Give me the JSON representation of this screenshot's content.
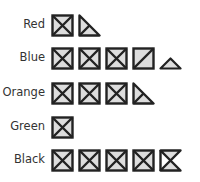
{
  "chart_data": {
    "type": "pictograph",
    "title": "",
    "unit_icon": "square with X (divided into 4 triangular quarters)",
    "categories": [
      "Red",
      "Blue",
      "Orange",
      "Green",
      "Black"
    ],
    "values": [
      1.5,
      4.25,
      3.5,
      1,
      4.5
    ],
    "icons": {
      "Red": [
        "full",
        "half-lower-left"
      ],
      "Blue": [
        "full",
        "full",
        "full",
        "diag-full",
        "quarter-bottom"
      ],
      "Orange": [
        "full",
        "full",
        "full",
        "half-lower-left"
      ],
      "Green": [
        "full"
      ],
      "Black": [
        "full",
        "full",
        "full",
        "full",
        "hourglass"
      ]
    },
    "colors": {
      "fill": "#dddddd",
      "stroke": "#222222",
      "label": "#333333"
    }
  },
  "rows": [
    {
      "label": "Red"
    },
    {
      "label": "Blue"
    },
    {
      "label": "Orange"
    },
    {
      "label": "Green"
    },
    {
      "label": "Black"
    }
  ]
}
